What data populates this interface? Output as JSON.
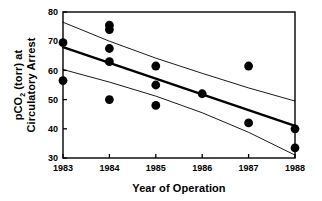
{
  "chart_data": {
    "type": "scatter",
    "title": "",
    "xlabel": "Year of Operation",
    "ylabel_line1": "pCO",
    "ylabel_sub": "2",
    "ylabel_line1_rest": " (torr) at",
    "ylabel_line2": "Circulatory Arrest",
    "ylabel_full": "pCO2 (torr) at Circulatory Arrest",
    "xlim": [
      1983,
      1988
    ],
    "ylim": [
      30,
      80
    ],
    "xticks": [
      1983,
      1984,
      1985,
      1986,
      1987,
      1988
    ],
    "xtick_labels": [
      "1983",
      "1984",
      "1985",
      "1986",
      "1987",
      "1988"
    ],
    "yticks": [
      30,
      40,
      50,
      60,
      70,
      80
    ],
    "ytick_labels": [
      "30",
      "40",
      "50",
      "60",
      "70",
      "80"
    ],
    "grid": false,
    "legend": null,
    "tick_direction": "in",
    "frame": "box",
    "points": [
      {
        "x": 1983,
        "y": 69.5
      },
      {
        "x": 1983,
        "y": 56.5
      },
      {
        "x": 1984,
        "y": 75.5
      },
      {
        "x": 1984,
        "y": 74.0
      },
      {
        "x": 1984,
        "y": 67.5
      },
      {
        "x": 1984,
        "y": 63.0
      },
      {
        "x": 1984,
        "y": 50.0
      },
      {
        "x": 1985,
        "y": 61.5
      },
      {
        "x": 1985,
        "y": 55.0
      },
      {
        "x": 1985,
        "y": 48.0
      },
      {
        "x": 1986,
        "y": 52.0
      },
      {
        "x": 1987,
        "y": 61.5
      },
      {
        "x": 1987,
        "y": 42.0
      },
      {
        "x": 1988,
        "y": 40.0
      },
      {
        "x": 1988,
        "y": 33.5
      }
    ],
    "series": [
      {
        "name": "regression-line",
        "style": "thick-solid",
        "x": [
          1983,
          1984,
          1985,
          1986,
          1987,
          1988
        ],
        "values": [
          68.0,
          62.6,
          57.2,
          51.8,
          46.4,
          41.0
        ]
      },
      {
        "name": "upper-confidence-band",
        "style": "thin-solid",
        "x": [
          1983,
          1984,
          1985,
          1986,
          1987,
          1988
        ],
        "values": [
          76.5,
          70.0,
          64.2,
          59.0,
          54.0,
          49.5
        ]
      },
      {
        "name": "lower-confidence-band",
        "style": "thin-solid",
        "x": [
          1983,
          1984,
          1985,
          1986,
          1987,
          1988
        ],
        "values": [
          60.3,
          56.0,
          51.2,
          45.5,
          38.8,
          31.0
        ]
      }
    ],
    "marker": {
      "shape": "circle",
      "color": "#000000",
      "size": 4.4
    },
    "colors": {
      "axis": "#000000",
      "marker": "#000000",
      "regression": "#000000",
      "band": "#000000",
      "background": "#ffffff"
    }
  }
}
